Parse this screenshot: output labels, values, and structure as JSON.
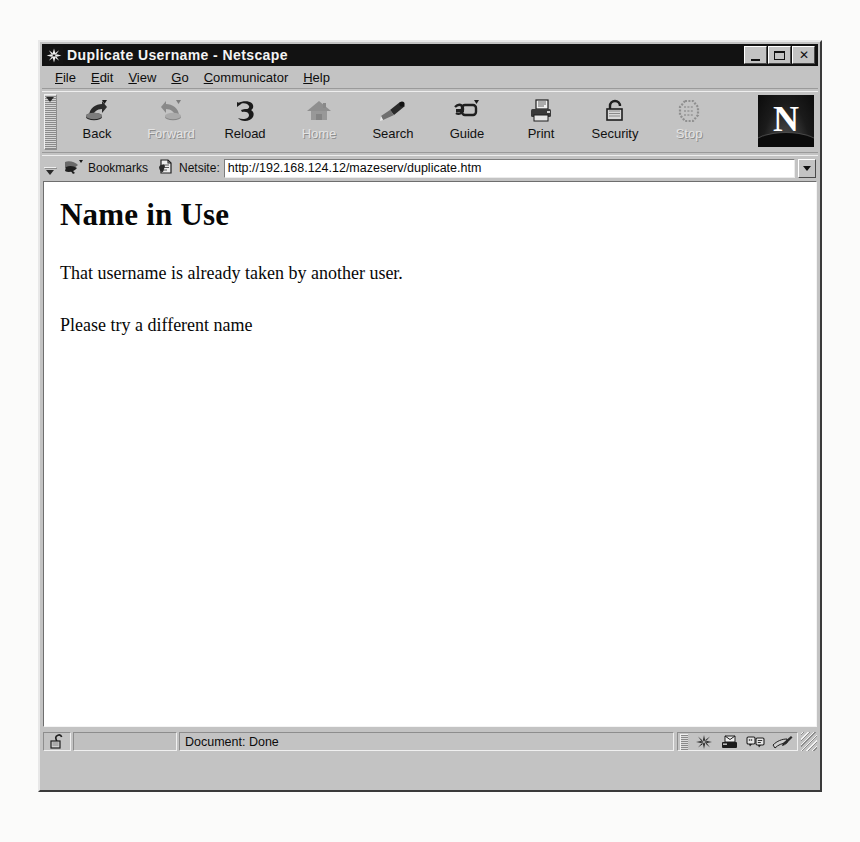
{
  "window": {
    "title": "Duplicate Username - Netscape",
    "title_icon": "netscape-compass-icon",
    "controls": {
      "minimize": "minimize-button",
      "maximize": "maximize-button",
      "close_label": "✕"
    }
  },
  "menu": {
    "items": [
      {
        "label": "File",
        "accel": "F"
      },
      {
        "label": "Edit",
        "accel": "E"
      },
      {
        "label": "View",
        "accel": "V"
      },
      {
        "label": "Go",
        "accel": "G"
      },
      {
        "label": "Communicator",
        "accel": "C"
      },
      {
        "label": "Help",
        "accel": "H"
      }
    ]
  },
  "toolbar": {
    "buttons": [
      {
        "label": "Back",
        "icon": "back-arrow-icon",
        "enabled": true
      },
      {
        "label": "Forward",
        "icon": "forward-arrow-icon",
        "enabled": false
      },
      {
        "label": "Reload",
        "icon": "reload-icon",
        "enabled": true
      },
      {
        "label": "Home",
        "icon": "home-icon",
        "enabled": false
      },
      {
        "label": "Search",
        "icon": "search-flashlight-icon",
        "enabled": true
      },
      {
        "label": "Guide",
        "icon": "guide-icon",
        "enabled": true
      },
      {
        "label": "Print",
        "icon": "print-icon",
        "enabled": true
      },
      {
        "label": "Security",
        "icon": "security-padlock-icon",
        "enabled": true
      },
      {
        "label": "Stop",
        "icon": "stop-sign-icon",
        "enabled": false
      }
    ],
    "logo_letter": "N"
  },
  "location": {
    "bookmarks_label": "Bookmarks",
    "bookmarks_icon": "bookmark-pointer-icon",
    "netsite_label": "Netsite:",
    "netsite_icon": "netsite-page-icon",
    "url": "http://192.168.124.12/mazeserv/duplicate.htm",
    "url_placeholder": "Enter a URL",
    "dropdown_icon": "chevron-down-icon"
  },
  "page": {
    "heading": "Name in Use",
    "paragraphs": [
      "That username is already taken by another user.",
      "Please try a different name"
    ]
  },
  "status": {
    "lock_icon": "unlocked-padlock-icon",
    "message": "Document: Done",
    "components": [
      {
        "name": "navigator",
        "icon": "navigator-compass-icon"
      },
      {
        "name": "mailbox",
        "icon": "inbox-mail-icon"
      },
      {
        "name": "discussions",
        "icon": "newsgroups-icon"
      },
      {
        "name": "composer",
        "icon": "composer-pen-icon"
      }
    ]
  },
  "colors": {
    "window_face": "#c3c3c3",
    "titlebar": "#121212",
    "titlebar_text": "#f4f4f4",
    "content_bg": "#ffffff",
    "text": "#080808"
  }
}
